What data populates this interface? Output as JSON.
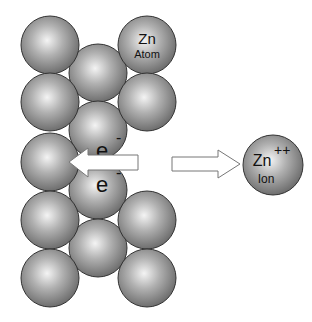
{
  "diagram": {
    "atom_label": {
      "symbol": "Zn",
      "name": "Atom"
    },
    "electron_top": {
      "symbol": "e",
      "charge": "-"
    },
    "electron_bottom": {
      "symbol": "e",
      "charge": "-"
    },
    "ion_label": {
      "symbol": "Zn",
      "charge": "++",
      "name": "Ion"
    },
    "colors": {
      "sphere_light": "#f2f2f2",
      "sphere_mid": "#a8a8a8",
      "sphere_dark": "#6e6e6e",
      "outline": "#333333",
      "arrow_fill": "#ffffff",
      "arrow_stroke": "#777777"
    }
  }
}
